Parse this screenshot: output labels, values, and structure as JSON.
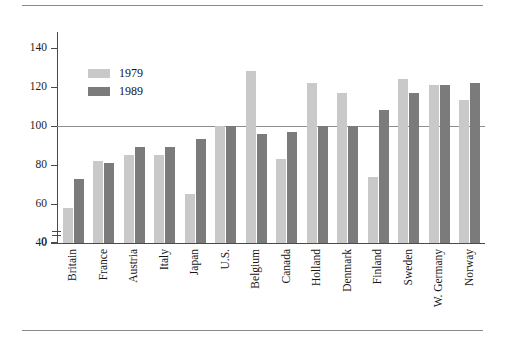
{
  "chart_data": {
    "type": "bar",
    "title": "",
    "subtitle": "",
    "xlabel": "",
    "ylabel": "",
    "categories": [
      "Britain",
      "France",
      "Austria",
      "Italy",
      "Japan",
      "U.S.",
      "Belgium",
      "Canada",
      "Holland",
      "Denmark",
      "Finland",
      "Sweden",
      "W. Germany",
      "Norway"
    ],
    "series": [
      {
        "name": "1979",
        "color": "#c9c9c9",
        "values": [
          58,
          82,
          85,
          85,
          65,
          100,
          128,
          83,
          122,
          117,
          74,
          124,
          121,
          113
        ]
      },
      {
        "name": "1989",
        "color": "#7b7b7b",
        "values": [
          73,
          81,
          89,
          89,
          93,
          100,
          96,
          97,
          100,
          100,
          108,
          117,
          121,
          122
        ]
      }
    ],
    "ylim": [
      40,
      148
    ],
    "yticks": [
      0,
      40,
      60,
      80,
      100,
      120,
      140
    ],
    "ytick_labels": [
      "0",
      "40",
      "60",
      "80",
      "100",
      "120",
      "140"
    ],
    "axis_break": true,
    "axis_break_between": [
      0,
      40
    ],
    "reference_line": 100,
    "grid": false,
    "legend_position": "upper-left-inside",
    "annotations": []
  },
  "legend": {
    "entries": [
      {
        "label": "1979",
        "swatch": "light-gray"
      },
      {
        "label": "1989",
        "swatch": "dark-gray"
      }
    ]
  },
  "colors": {
    "series_1979": "#c9c9c9",
    "series_1989": "#7b7b7b",
    "axis": "#4a4a4a",
    "rule": "#8a8a8a",
    "reference_line": "#8d8d8d",
    "text": "#1a1a1a",
    "background": "#ffffff"
  }
}
